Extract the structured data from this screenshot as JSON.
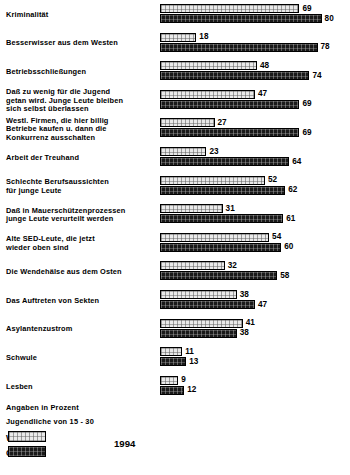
{
  "chart_data": {
    "type": "bar",
    "orientation": "horizontal",
    "title": "",
    "subtitle": "",
    "xlabel": "",
    "ylabel": "",
    "unit_note": "Angaben in Prozent",
    "population_note": "Jugendliche von 15 - 30",
    "year": "1994",
    "xlim": [
      0,
      80
    ],
    "grid": false,
    "legend_position": "bottom-left",
    "categories": [
      "Kriminalität",
      "Besserwisser aus dem Westen",
      "Betriebsschließungen",
      "Daß zu wenig für die Jugend\ngetan wird. Junge Leute bleiben\nsich selbst überlassen",
      "Westl. Firmen, die hier billig\nBetriebe kaufen u. dann die\nKonkurrenz ausschalten",
      "Arbeit der Treuhand",
      "Schlechte Berufsaussichten\nfür junge Leute",
      "Daß in Mauerschützenprozessen\njunge Leute verurteilt werden",
      "Alte SED-Leute, die jetzt\nwieder oben sind",
      "Die Wendehälse aus dem Osten",
      "Das Auftreten von Sekten",
      "Asylantenzustrom",
      "Schwule",
      "Lesben"
    ],
    "series": [
      {
        "name": "West",
        "color": "#e9e9e9",
        "values": [
          69,
          18,
          48,
          47,
          27,
          23,
          52,
          31,
          54,
          32,
          38,
          41,
          11,
          9
        ]
      },
      {
        "name": "Ost",
        "color": "#1a1a1a",
        "values": [
          80,
          78,
          74,
          69,
          69,
          64,
          62,
          61,
          60,
          58,
          47,
          38,
          13,
          12
        ]
      }
    ]
  },
  "footer": {
    "unit_note": "Angaben in Prozent",
    "population_note": "Jugendliche von 15 - 30",
    "legend": [
      {
        "label": "West"
      },
      {
        "label": "Ost"
      }
    ],
    "year": "1994",
    "credit": ""
  }
}
